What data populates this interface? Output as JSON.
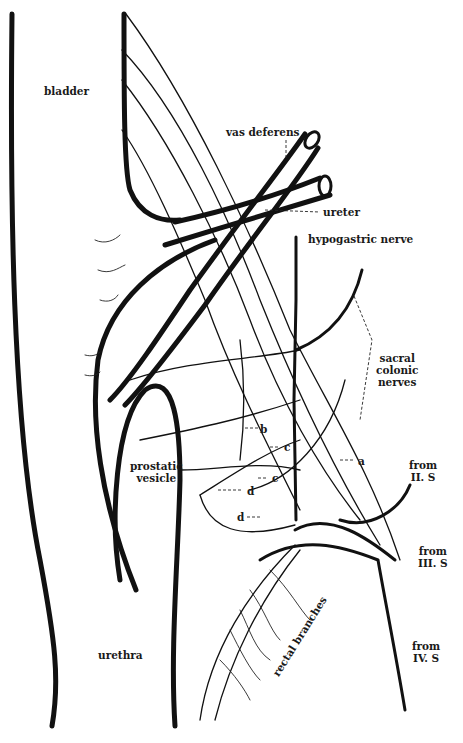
{
  "figure": {
    "type": "anatomical line drawing",
    "line_color": "#111111",
    "background": "#ffffff"
  },
  "labels": {
    "bladder": "bladder",
    "vas_deferens": "vas deferens",
    "ureter": "ureter",
    "hypogastric_nerve": "hypogastric nerve",
    "sacral_colonic_nerves": [
      "sacral",
      "colonic",
      "nerves"
    ],
    "prostatic_vesicle": [
      "prostatic",
      "vesicle"
    ],
    "urethra": "urethra",
    "rectal_branches": "rectal branches",
    "from_II_S": [
      "from",
      "II. S"
    ],
    "from_III_S": [
      "from",
      "III. S"
    ],
    "from_IV_S": [
      "from",
      "IV. S"
    ],
    "letter_a": "a",
    "letter_b": "b",
    "letter_c1": "c",
    "letter_c2": "c",
    "letter_d1": "d",
    "letter_d2": "d"
  }
}
